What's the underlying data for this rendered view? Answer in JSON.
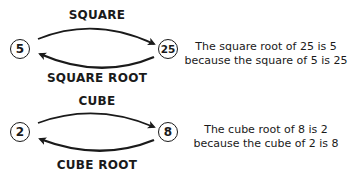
{
  "square": {
    "top_label": "SQUARE",
    "bottom_label": "SQUARE ROOT",
    "left_value": "5",
    "right_value": "25",
    "explanation": {
      "line1": "The square root of 25 is 5",
      "line2": "because the square of 5 is 25"
    }
  },
  "cube": {
    "top_label": "CUBE",
    "bottom_label": "CUBE ROOT",
    "left_value": "2",
    "right_value": "8",
    "explanation": {
      "line1": "The cube root of 8 is 2",
      "line2": "because the cube of 2 is 8"
    }
  }
}
